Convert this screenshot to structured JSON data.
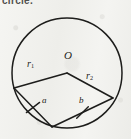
{
  "figure": {
    "type": "geometry-diagram",
    "subject": "circle",
    "background_color": "#f1f1ee",
    "ink_color": "#1d1d1b",
    "header_cut_text": "circle.",
    "ghost_text": "",
    "circle": {
      "center_label": "O",
      "center_x": 67,
      "center_y": 73,
      "radius": 55
    },
    "points": [
      {
        "name": "center",
        "label": "O",
        "x": 67,
        "y": 73
      },
      {
        "name": "left-vertex",
        "label": "",
        "x": 14,
        "y": 88
      },
      {
        "name": "right-vertex",
        "label": "",
        "x": 113,
        "y": 98
      },
      {
        "name": "bottom-vertex",
        "label": "",
        "x": 52,
        "y": 127
      }
    ],
    "segments": [
      {
        "name": "radius-1",
        "label": "r",
        "sub": "1",
        "from": "center",
        "to": "left-vertex",
        "ticks": 0
      },
      {
        "name": "radius-2",
        "label": "r",
        "sub": "2",
        "from": "center",
        "to": "right-vertex",
        "ticks": 0
      },
      {
        "name": "chord-a",
        "label": "a",
        "sub": "",
        "from": "left-vertex",
        "to": "bottom-vertex",
        "ticks": 1
      },
      {
        "name": "chord-b",
        "label": "b",
        "sub": "",
        "from": "bottom-vertex",
        "to": "right-vertex",
        "ticks": 1
      }
    ],
    "labels": {
      "center": "O",
      "radius_1_base": "r",
      "radius_1_sub": "1",
      "radius_2_base": "r",
      "radius_2_sub": "2",
      "side_a": "a",
      "side_b": "b"
    }
  }
}
